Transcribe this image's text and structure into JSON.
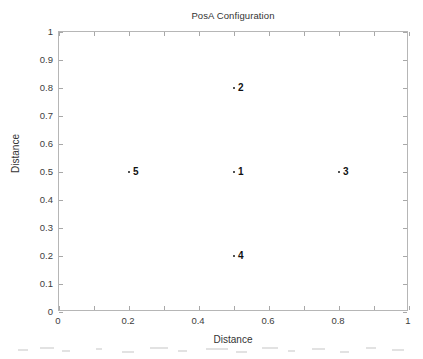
{
  "chart_data": {
    "type": "scatter",
    "title": "PosA Configuration",
    "xlabel": "Distance",
    "ylabel": "Distance",
    "xlim": [
      0,
      1
    ],
    "ylim": [
      0,
      1
    ],
    "grid": false,
    "legend": null,
    "xticks": [
      "0",
      "0.2",
      "0.4",
      "0.6",
      "0.8",
      "1"
    ],
    "xtick_values": [
      0,
      0.2,
      0.4,
      0.6,
      0.8,
      1
    ],
    "yticks": [
      "0",
      "0.1",
      "0.2",
      "0.3",
      "0.4",
      "0.5",
      "0.6",
      "0.7",
      "0.8",
      "0.9",
      "1"
    ],
    "ytick_values": [
      0,
      0.1,
      0.2,
      0.3,
      0.4,
      0.5,
      0.6,
      0.7,
      0.8,
      0.9,
      1
    ],
    "points": [
      {
        "label": "1",
        "x": 0.5,
        "y": 0.5
      },
      {
        "label": "2",
        "x": 0.5,
        "y": 0.8
      },
      {
        "label": "3",
        "x": 0.8,
        "y": 0.5
      },
      {
        "label": "4",
        "x": 0.5,
        "y": 0.2
      },
      {
        "label": "5",
        "x": 0.2,
        "y": 0.5
      }
    ],
    "marker_color": "#1a1a1a",
    "axis_color": "#b6b6b6",
    "background_color": "#ffffff"
  }
}
